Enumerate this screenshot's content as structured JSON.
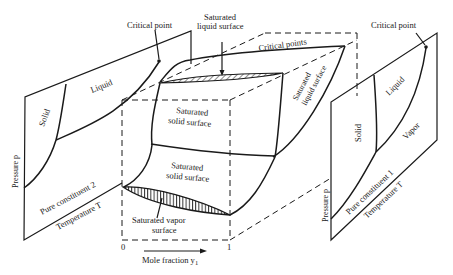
{
  "figure": {
    "type": "3D binary phase diagram (pressure-temperature-composition)",
    "left_panel": {
      "title": "Pure constituent 2",
      "axis_pressure": "Pressure p",
      "axis_temperature": "Temperature T",
      "regions": [
        "Solid",
        "Liquid"
      ],
      "critical_point_label": "Critical point"
    },
    "center_box": {
      "labels": {
        "saturated_liquid_surface_top": "Saturated\nliquid surface",
        "saturated_liquid_surface_top_line1": "Saturated",
        "saturated_liquid_surface_top_line2": "liquid surface",
        "critical_points": "Critical points",
        "saturated_liquid_surface_side_line1": "Saturated",
        "saturated_liquid_surface_side_line2": "liquid surface",
        "saturated_solid_surface_upper_line1": "Saturated",
        "saturated_solid_surface_upper_line2": "solid surface",
        "saturated_solid_surface_lower_line1": "Saturated",
        "saturated_solid_surface_lower_line2": "solid surface",
        "saturated_vapor_surface_line1": "Saturated vapor",
        "saturated_vapor_surface_line2": "surface"
      },
      "x_axis": {
        "label": "Mole fraction y",
        "subscript": "1",
        "tick_start": "0",
        "tick_end": "1"
      }
    },
    "right_panel": {
      "title": "Pure constituent 1",
      "axis_pressure": "Pressure p",
      "axis_temperature": "Temperature T",
      "regions": [
        "Solid",
        "Liquid",
        "Vapor"
      ],
      "critical_point_label": "Critical point"
    }
  }
}
